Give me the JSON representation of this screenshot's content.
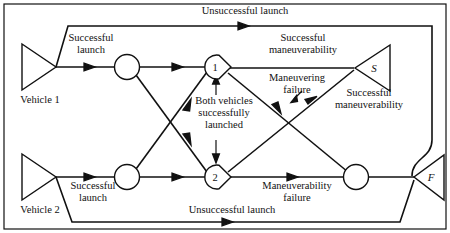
{
  "diagram": {
    "type": "flow-network",
    "background_color": "#ffffff",
    "line_color": "#111111",
    "sources": [
      {
        "id": "vehicle1",
        "label": "Vehicle 1",
        "shape": "triangle-right",
        "x": 55,
        "y": 67
      },
      {
        "id": "vehicle2",
        "label": "Vehicle 2",
        "shape": "triangle-right",
        "x": 55,
        "y": 177
      }
    ],
    "terminals": [
      {
        "id": "success",
        "label": "S",
        "shape": "triangle-left",
        "x": 355,
        "y": 68
      },
      {
        "id": "failure",
        "label": "F",
        "shape": "triangle-left",
        "x": 416,
        "y": 177
      }
    ],
    "nodes": [
      {
        "id": "n_top_left",
        "label": "",
        "shape": "circle",
        "x": 127,
        "y": 67
      },
      {
        "id": "n_bottom_left",
        "label": "",
        "shape": "circle",
        "x": 127,
        "y": 177
      },
      {
        "id": "n1",
        "label": "1",
        "shape": "circle-notched",
        "x": 216,
        "y": 67
      },
      {
        "id": "n2",
        "label": "2",
        "shape": "circle-notched",
        "x": 216,
        "y": 177
      },
      {
        "id": "n_bottom_right",
        "label": "",
        "shape": "circle",
        "x": 356,
        "y": 177
      }
    ],
    "edge_labels": [
      {
        "id": "lbl_unsuccessful_top",
        "text_lines": [
          "Unsuccessful launch"
        ],
        "x": 245,
        "y": 11
      },
      {
        "id": "lbl_successful_launch_1",
        "text_lines": [
          "Successful",
          "launch"
        ],
        "x": 90,
        "y": 42
      },
      {
        "id": "lbl_successful_maneuverability_top",
        "text_lines": [
          "Successful",
          "maneuverability"
        ],
        "x": 303,
        "y": 42
      },
      {
        "id": "lbl_maneuvering_failure",
        "text_lines": [
          "Maneuvering",
          "failure"
        ],
        "x": 297,
        "y": 83
      },
      {
        "id": "lbl_both_vehicles",
        "text_lines": [
          "Both vehicles",
          "successfully",
          "launched"
        ],
        "x": 224,
        "y": 108
      },
      {
        "id": "lbl_successful_maneuverability_right",
        "text_lines": [
          "Successful",
          "maneuverability"
        ],
        "x": 367,
        "y": 98
      },
      {
        "id": "lbl_maneuverability_failure",
        "text_lines": [
          "Maneuverability",
          "failure"
        ],
        "x": 297,
        "y": 188
      },
      {
        "id": "lbl_successful_launch_2",
        "text_lines": [
          "Successful",
          "launch"
        ],
        "x": 92,
        "y": 188
      },
      {
        "id": "lbl_unsuccessful_bottom",
        "text_lines": [
          "Unsuccessful launch"
        ],
        "x": 232,
        "y": 210
      }
    ]
  }
}
